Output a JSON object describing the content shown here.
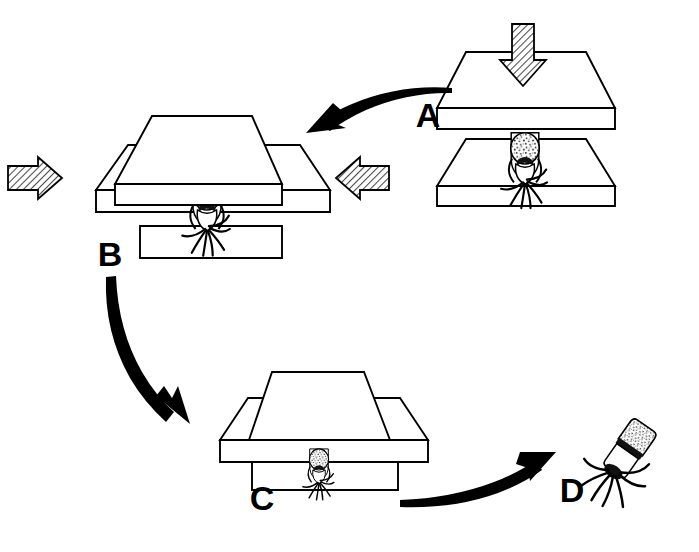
{
  "figure": {
    "background_color": "#ffffff",
    "line_color": "#000000",
    "hatch_color": "#555555",
    "width": 699,
    "height": 552
  },
  "panels": [
    {
      "id": "A",
      "label": "A",
      "label_x": 428,
      "label_y": 118,
      "caption": "Upper plate descends onto specimen between open plates",
      "stage": 1,
      "plate_gap": "open",
      "force_arrow": "down"
    },
    {
      "id": "B",
      "label": "B",
      "label_x": 110,
      "label_y": 257,
      "caption": "Lateral compression from both sides while plates close",
      "stage": 2,
      "plate_gap": "partly-closed",
      "force_arrow": "lateral-both"
    },
    {
      "id": "C",
      "label": "C",
      "label_x": 262,
      "label_y": 501,
      "caption": "Plates fully closed, specimen compressed",
      "stage": 3,
      "plate_gap": "closed",
      "force_arrow": "none"
    },
    {
      "id": "D",
      "label": "D",
      "label_x": 572,
      "label_y": 493,
      "caption": "Extracted specimen with radiating filaments",
      "stage": 4,
      "plate_gap": "none",
      "force_arrow": "none"
    }
  ],
  "flow_arrows": [
    {
      "name": "arrow-a-to-b",
      "from": "A",
      "to": "B",
      "style": "curved-tapered",
      "direction": "right-to-left"
    },
    {
      "name": "arrow-b-to-c",
      "from": "B",
      "to": "C",
      "style": "curved-tapered",
      "direction": "down-right"
    },
    {
      "name": "arrow-c-to-d",
      "from": "C",
      "to": "D",
      "style": "curved-tapered",
      "direction": "left-to-right-up"
    }
  ],
  "force_arrows": [
    {
      "name": "force-arrow-down-a",
      "panel": "A",
      "direction": "down",
      "fill": "hatched"
    },
    {
      "name": "force-arrow-right-b",
      "panel": "B",
      "direction": "right",
      "fill": "hatched"
    },
    {
      "name": "force-arrow-left-b",
      "panel": "B",
      "direction": "left",
      "fill": "hatched"
    }
  ],
  "specimen": {
    "name": "specimen",
    "head_texture": "speckled",
    "tentacle_count": 7,
    "body_color": "#ffffff",
    "outline_color": "#000000"
  }
}
